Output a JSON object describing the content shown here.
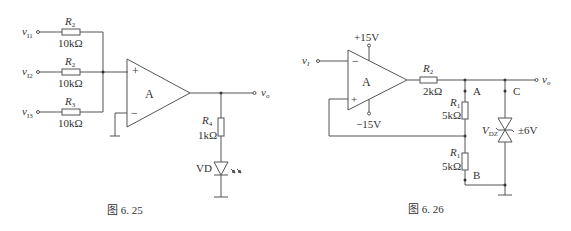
{
  "figure_25": {
    "caption": "图 6. 25",
    "inputs": [
      {
        "label": "v",
        "sub": "I1",
        "res_name": "R",
        "res_sub": "2",
        "res_value": "10kΩ"
      },
      {
        "label": "v",
        "sub": "I2",
        "res_name": "R",
        "res_sub": "2",
        "res_value": "10kΩ"
      },
      {
        "label": "v",
        "sub": "I3",
        "res_name": "R",
        "res_sub": "3",
        "res_value": "10kΩ"
      }
    ],
    "opamp": {
      "label": "A",
      "plus": "+",
      "minus": "−"
    },
    "r4": {
      "name": "R",
      "sub": "4",
      "value": "1kΩ"
    },
    "led": {
      "label": "VD"
    },
    "output": {
      "label": "v",
      "sub": "o"
    }
  },
  "figure_26": {
    "caption": "图 6. 26",
    "input": {
      "label": "v",
      "sub": "I"
    },
    "opamp": {
      "label": "A",
      "plus": "+",
      "minus": "−",
      "vpos": "+15V",
      "vneg": "−15V"
    },
    "r2": {
      "name": "R",
      "sub": "2",
      "value": "2kΩ"
    },
    "r1_top": {
      "name": "R",
      "sub": "1",
      "value": "5kΩ"
    },
    "r1_bottom": {
      "name": "R",
      "sub": "1",
      "value": "5kΩ"
    },
    "zener": {
      "name": "V",
      "sub": "DZ",
      "value": "±6V"
    },
    "nodes": {
      "a": "A",
      "b": "B",
      "c": "C"
    },
    "output": {
      "label": "v",
      "sub": "o"
    }
  }
}
